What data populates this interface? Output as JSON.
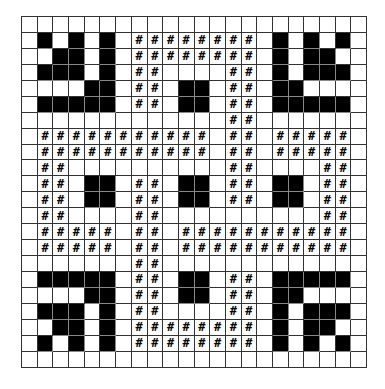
{
  "board": {
    "rows": 22,
    "cols": 22,
    "legend": {
      "B": "filled-black-cell",
      "#": "hash-marked-cell",
      ".": "empty-cell"
    },
    "mark_glyph": "#",
    "colors": {
      "filled": "#000000",
      "empty": "#ffffff",
      "grid": "#333333"
    },
    "grid": [
      "......................",
      ".B.B.B.########.B.B.B.",
      "..BB.B.########.B.BB..",
      ".BBB.B.##....##.B.BBB.",
      "....BB.##.BB.##.BB....",
      ".BBBBB.##.BB.##.BBBBB.",
      ".............##.......",
      ".###########.##.#####.",
      ".###########.##.#####.",
      ".##..........##....##.",
      ".##.BB.##.BB.##.BB.##.",
      ".##.BB.##.BB.##.BB.##.",
      ".##....##..........##.",
      ".#####.##.###########.",
      ".#####.##.###########.",
      ".......##.............",
      ".BBBBB.##.BB.##.BBBBB.",
      "....BB.##.BB.##.BB....",
      ".BBB.B.##....##.B.BBB.",
      "..BB.B.########.B.BB..",
      ".B.B.B.########.B.B.B.",
      "......................"
    ]
  }
}
